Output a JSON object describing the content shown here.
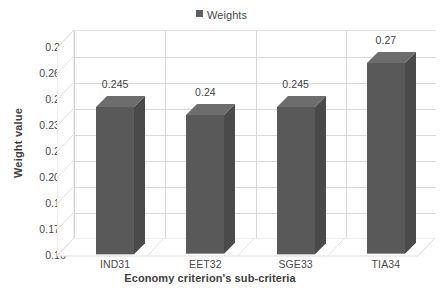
{
  "chart_data": {
    "type": "bar",
    "title": "",
    "categories": [
      "IND31",
      "EET32",
      "SGE33",
      "TIA34"
    ],
    "series": [
      {
        "name": "Weights",
        "values": [
          0.245,
          0.24,
          0.245,
          0.27
        ],
        "color": "#595959"
      }
    ],
    "data_labels": [
      "0.245",
      "0.24",
      "0.245",
      "0.27"
    ],
    "xlabel": "Economy criterion's sub-criteria",
    "ylabel": "Weight value",
    "ylim": [
      0.16,
      0.28
    ],
    "ytick_step": 0.015,
    "ytick_labels": [
      "0.28",
      "0.265",
      "0.25",
      "0.235",
      "0.22",
      "0.205",
      "0.19",
      "0.175",
      "0.16"
    ],
    "ytick_values": [
      0.28,
      0.265,
      0.25,
      0.235,
      0.22,
      0.205,
      0.19,
      0.175,
      0.16
    ],
    "grid": true,
    "grid_axes": "both",
    "legend_position": "top-center",
    "three_d": true
  },
  "legend": {
    "entries": [
      {
        "label": "Weights",
        "color": "#5f5f5f"
      }
    ]
  },
  "axes": {
    "y_title": "Weight value",
    "x_title": "Economy criterion's sub-criteria"
  },
  "colors": {
    "bar_front": "#595959",
    "bar_side": "#4a4a4a",
    "bar_top": "#6d6d6d",
    "gridline": "#d9d9d9",
    "wall": "#ffffff",
    "text": "#3f3f3f",
    "background": "#ffffff"
  }
}
